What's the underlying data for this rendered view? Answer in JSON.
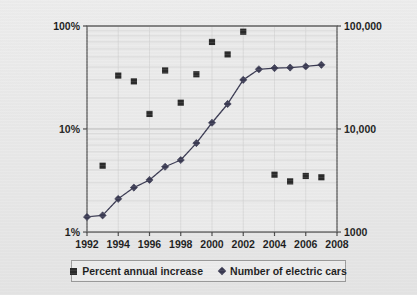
{
  "chart_data": {
    "type": "scatter",
    "title": "",
    "subtitle": "",
    "xlabel": "",
    "ylabel": "",
    "y2label": "",
    "grid": true,
    "legend_position": "bottom",
    "x_ticks": [
      "1992",
      "1994",
      "1996",
      "1998",
      "2000",
      "2002",
      "2004",
      "2006",
      "2008"
    ],
    "xlim": [
      1992,
      2008
    ],
    "y_left_ticks": [
      "1%",
      "10%",
      "100%"
    ],
    "ylim_left": [
      1,
      100
    ],
    "y_left_scale": "log",
    "y_right_ticks": [
      "1000",
      "10,000",
      "100,000"
    ],
    "ylim_right": [
      1000,
      100000
    ],
    "y_right_scale": "log",
    "series": [
      {
        "name": "Percent annual increase",
        "marker": "square",
        "color": "#2a2a2a",
        "axis": "left",
        "line": false,
        "x": [
          1993,
          1994,
          1995,
          1996,
          1997,
          1998,
          1999,
          2000,
          2001,
          2002,
          2004,
          2005,
          2006,
          2007
        ],
        "values": [
          4.4,
          33,
          29,
          14,
          37,
          18,
          34,
          70,
          53,
          88,
          3.6,
          3.1,
          3.5,
          3.4
        ]
      },
      {
        "name": "Number of electric cars",
        "marker": "diamond",
        "color": "#3a3a52",
        "axis": "right",
        "line": true,
        "x": [
          1992,
          1993,
          1994,
          1995,
          1996,
          1997,
          1998,
          1999,
          2000,
          2001,
          2002,
          2003,
          2004,
          2005,
          2006,
          2007
        ],
        "values": [
          1400,
          1450,
          2100,
          2700,
          3200,
          4300,
          5000,
          7300,
          11500,
          17500,
          30000,
          38000,
          39000,
          39500,
          40500,
          42000
        ]
      }
    ]
  },
  "legend": {
    "entries": [
      {
        "label": "Percent annual increase",
        "marker": "square"
      },
      {
        "label": "Number of electric cars",
        "marker": "diamond"
      }
    ]
  },
  "colors": {
    "background": "#e9e9e9",
    "plot_background": "#eaeaea",
    "axis": "#555555",
    "grid": "#c9c9c9",
    "square_series": "#2a2a2a",
    "diamond_series": "#3a3a52",
    "text": "#1b1b1b"
  }
}
